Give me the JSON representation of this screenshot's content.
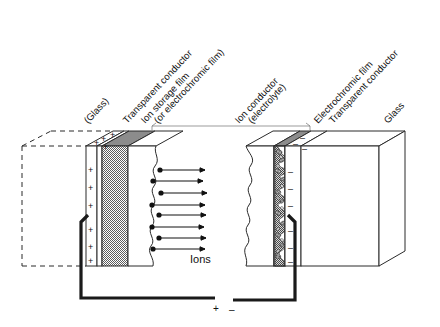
{
  "figure": {
    "ions_label": "Ions"
  },
  "labels": [
    {
      "id": "glass-left",
      "text": "(Glass)"
    },
    {
      "id": "transparent-conductor-left",
      "text": "Transparent conductor"
    },
    {
      "id": "ion-storage-film",
      "text": "Ion storage film"
    },
    {
      "id": "ion-storage-film-alt",
      "text": "(or electrochromic film)"
    },
    {
      "id": "ion-conductor",
      "text": "Ion conductor"
    },
    {
      "id": "ion-conductor-alt",
      "text": "(electrolyte)"
    },
    {
      "id": "electrochromic-film",
      "text": "Electrochromic film"
    },
    {
      "id": "transparent-conductor-right",
      "text": "Transparent conductor"
    },
    {
      "id": "glass-right",
      "text": "Glass"
    }
  ],
  "terminals": {
    "positive": "+",
    "negative": "–"
  },
  "charges": {
    "positive_symbol": "+",
    "negative_symbol": "–",
    "positive_count_front": 6,
    "positive_count_top": 4,
    "negative_count_front": 6,
    "negative_count_top": 3
  },
  "ions": {
    "count": 8,
    "arrow_direction": "right"
  },
  "colors": {
    "background": "#ffffff",
    "outline": "#2b2b2b",
    "wire": "#1a1a1a",
    "film_fill": "#9a9a9a",
    "film_fill_dark": "#7d7d7d",
    "leader": "#6b6b6b",
    "dashed": "#2b2b2b"
  }
}
